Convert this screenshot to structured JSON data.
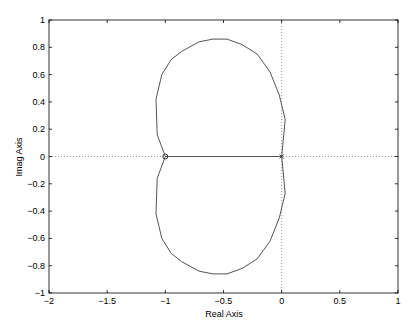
{
  "chart_data": {
    "type": "line",
    "title": "",
    "xlabel": "Real Axis",
    "ylabel": "Imag Axis",
    "xlim": [
      -2,
      1
    ],
    "ylim": [
      -1,
      1
    ],
    "grid": false,
    "xticks": [
      "-2",
      "-1.5",
      "-1",
      "-0.5",
      "0",
      "0.5",
      "1"
    ],
    "yticks": [
      "1",
      "0.8",
      "0.6",
      "0.4",
      "0.2",
      "0",
      "-0.2",
      "-0.4",
      "-0.6",
      "-0.8",
      "-1"
    ],
    "reference_lines": [
      {
        "orientation": "horizontal",
        "value": 0,
        "style": "dotted"
      },
      {
        "orientation": "vertical",
        "value": 0,
        "style": "dotted"
      }
    ],
    "series": [
      {
        "name": "locus-upper",
        "x": [
          -1.0,
          -1.07,
          -1.08,
          -1.03,
          -0.95,
          -0.86,
          -0.71,
          -0.59,
          -0.47,
          -0.34,
          -0.21,
          -0.1,
          -0.02,
          0.03,
          0.0
        ],
        "y": [
          0.0,
          0.16,
          0.42,
          0.6,
          0.71,
          0.77,
          0.84,
          0.86,
          0.86,
          0.82,
          0.75,
          0.62,
          0.45,
          0.27,
          0.0
        ]
      },
      {
        "name": "locus-lower",
        "x": [
          -1.0,
          -1.07,
          -1.08,
          -1.03,
          -0.95,
          -0.86,
          -0.71,
          -0.59,
          -0.47,
          -0.34,
          -0.21,
          -0.1,
          -0.02,
          0.03,
          0.0
        ],
        "y": [
          0.0,
          -0.16,
          -0.42,
          -0.6,
          -0.71,
          -0.77,
          -0.84,
          -0.86,
          -0.86,
          -0.82,
          -0.75,
          -0.62,
          -0.45,
          -0.27,
          0.0
        ]
      },
      {
        "name": "real-axis-segment",
        "x": [
          -1.0,
          0.0
        ],
        "y": [
          0.0,
          0.0
        ]
      }
    ],
    "markers": [
      {
        "type": "zero",
        "symbol": "o",
        "x": -1,
        "y": 0
      },
      {
        "type": "pole",
        "symbol": "x",
        "x": 0,
        "y": 0
      }
    ]
  },
  "colors": {
    "line": "#555555",
    "axis": "#000000",
    "reference": "#999999"
  }
}
